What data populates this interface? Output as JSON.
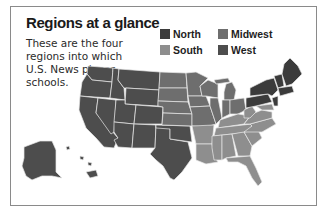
{
  "title": "Regions at a glance",
  "subtitle": "These are the four regions into which U.S. News places schools.",
  "legend": [
    {
      "label": "North",
      "color": "#3b3b3b"
    },
    {
      "label": "Midwest",
      "color": "#6e6e6e"
    },
    {
      "label": "South",
      "color": "#8e8e8e"
    },
    {
      "label": "West",
      "color": "#4d4d4d"
    }
  ],
  "map": {
    "description": "U.S. map shaded by region",
    "regions": {
      "West": "#4d4d4d",
      "Midwest": "#6e6e6e",
      "South": "#8e8e8e",
      "North": "#3b3b3b"
    },
    "border_color": "#e8e8e8"
  }
}
